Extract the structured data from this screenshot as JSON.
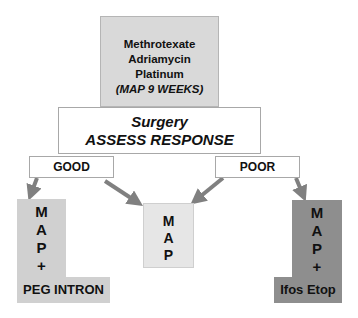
{
  "top_box": {
    "lines": [
      "Methrotexate",
      "Adriamycin",
      "Platinum"
    ],
    "italic_line": "(MAP 9 WEEKS)"
  },
  "surgery_box": {
    "line1": "Surgery",
    "line2": "ASSESS RESPONSE"
  },
  "responses": {
    "good": "GOOD",
    "poor": "POOR"
  },
  "outcomes": {
    "left": {
      "letters": [
        "M",
        "A",
        "P",
        "+"
      ],
      "label": "PEG INTRON",
      "color": "#d0d0d0"
    },
    "center": {
      "letters": [
        "M",
        "A",
        "P"
      ],
      "color": "#e6e6e6"
    },
    "right": {
      "letters": [
        "M",
        "A",
        "P",
        "+"
      ],
      "label": "Ifos Etop",
      "color": "#8e8e8e"
    }
  },
  "arrow_color": "#808080"
}
